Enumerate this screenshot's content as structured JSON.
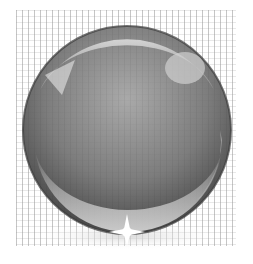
{
  "image": {
    "subject": "glass-sphere",
    "description": "Grayscale glossy glass sphere on a dotted grid background with a star-shaped sparkle at the bottom",
    "colors": {
      "background": "#ffffff",
      "sphere_light": "#bdbdbd",
      "sphere_mid": "#8a8a8a",
      "sphere_dark": "#4a4a4a",
      "rim": "#3a3a3a",
      "highlight": "#e6e6e6",
      "sparkle": "#ffffff"
    }
  }
}
